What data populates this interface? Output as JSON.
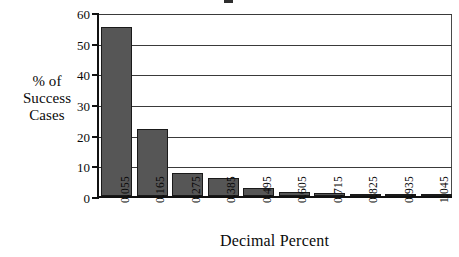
{
  "chart_data": {
    "type": "bar",
    "title": "",
    "xlabel": "Decimal Percent",
    "ylabel": "% of\nSuccess\nCases",
    "categories": [
      "0.055",
      "0.165",
      "0.275",
      "0.385",
      "0.495",
      "0.605",
      "0.715",
      "0.825",
      "0.935",
      "1.045"
    ],
    "values": [
      55,
      21.8,
      7.5,
      6.0,
      2.5,
      1.2,
      1.0,
      0.3,
      0.4,
      0.2
    ],
    "ylim": [
      0,
      60
    ],
    "yticks": [
      0,
      10,
      20,
      30,
      40,
      50,
      60
    ],
    "ytick_labels": [
      "0",
      "10",
      "20",
      "30",
      "40",
      "50",
      "60"
    ],
    "grid": "horizontal",
    "legend": "none",
    "bar_color": "#565656",
    "bar_edge_color": "#1a1a1a",
    "axis_color": "#111111"
  },
  "figure": {
    "y_axis_title_text": "% of\nSuccess\nCases",
    "x_axis_title_text": "Decimal Percent"
  }
}
